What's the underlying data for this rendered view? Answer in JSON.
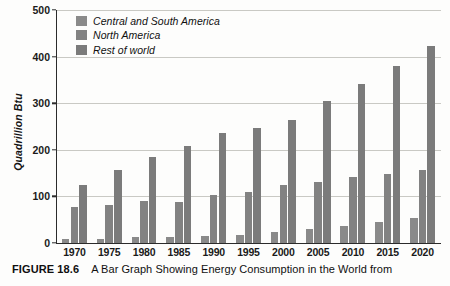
{
  "figure": {
    "caption_label": "FIGURE 18.6",
    "caption_text": "A Bar Graph Showing Energy Consumption in the World from"
  },
  "legend": {
    "position": "top-left-inside",
    "items": [
      {
        "label": "Central and South America",
        "color": "#8a8a8a"
      },
      {
        "label": "North America",
        "color": "#828282"
      },
      {
        "label": "Rest of world",
        "color": "#7b7b7b"
      }
    ]
  },
  "axes": {
    "y_title": "Quadrillion Btu",
    "y_ticks": [
      "500",
      "400",
      "300",
      "200",
      "100",
      "0"
    ],
    "x_ticks": [
      "1970",
      "1975",
      "1980",
      "1985",
      "1990",
      "1995",
      "2000",
      "2005",
      "2010",
      "2015",
      "2020"
    ]
  },
  "chart_data": {
    "type": "bar",
    "title": "A Bar Graph Showing Energy Consumption in the World from",
    "xlabel": "",
    "ylabel": "Quadrillion Btu",
    "ylim": [
      0,
      500
    ],
    "ytick_step": 100,
    "grid": true,
    "legend_position": "upper left (inside plot)",
    "categories": [
      "1970",
      "1975",
      "1980",
      "1985",
      "1990",
      "1995",
      "2000",
      "2005",
      "2010",
      "2015",
      "2020"
    ],
    "series": [
      {
        "name": "Central and South America",
        "color": "#8a8a8a",
        "values": [
          8,
          8,
          12,
          13,
          16,
          18,
          23,
          30,
          37,
          46,
          53
        ]
      },
      {
        "name": "North America",
        "color": "#828282",
        "values": [
          77,
          82,
          91,
          89,
          102,
          110,
          124,
          131,
          141,
          148,
          156
        ]
      },
      {
        "name": "Rest of world",
        "color": "#7b7b7b",
        "values": [
          125,
          156,
          185,
          208,
          236,
          246,
          265,
          305,
          342,
          380,
          423
        ]
      }
    ]
  }
}
